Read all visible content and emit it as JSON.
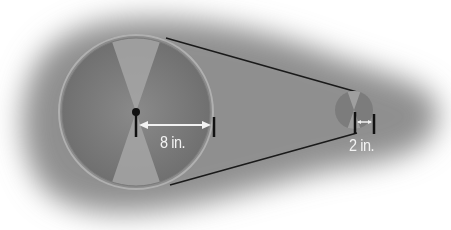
{
  "diagram": {
    "type": "belt-and-pulley",
    "background_color": "#ffffff",
    "shadow_color": "#8f8f8f",
    "belt_color": "#1a1a1a",
    "large_pulley": {
      "center": [
        136,
        112
      ],
      "radius_px": 78,
      "rim_color": "#9a9a9a",
      "face_dark": "#6e6e6e",
      "face_light": "#a8a8a8",
      "radius_label": "8 in."
    },
    "small_pulley": {
      "center": [
        354,
        110
      ],
      "radius_px": 19,
      "face_dark": "#6e6e6e",
      "face_light": "#a8a8a8",
      "radius_label": "2 in."
    }
  }
}
